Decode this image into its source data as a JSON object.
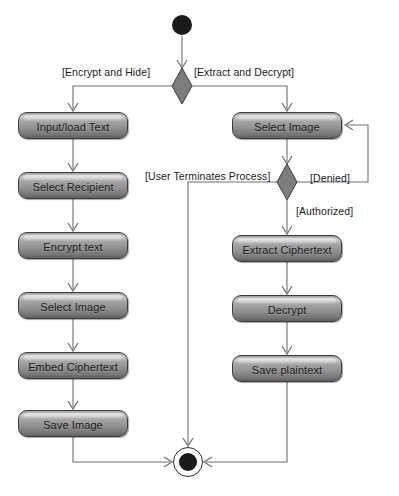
{
  "diagram": {
    "type": "uml-activity-diagram",
    "initial_node": {
      "name": "start",
      "cx": 182,
      "cy": 25,
      "r": 10
    },
    "final_node": {
      "name": "end",
      "cx": 188,
      "cy": 462,
      "outer_r": 15,
      "inner_r": 9
    },
    "decisions": [
      {
        "id": "d1",
        "name": "mode-decision",
        "cx": 182,
        "cy": 86,
        "rx": 10,
        "ry": 18
      },
      {
        "id": "d2",
        "name": "authorization-decision",
        "cx": 287,
        "cy": 182,
        "rx": 10,
        "ry": 18
      }
    ],
    "activities": [
      {
        "id": "a1",
        "label": "Input/load Text",
        "x": 18,
        "y": 112,
        "w": 110,
        "h": 27,
        "branch": "encrypt"
      },
      {
        "id": "a2",
        "label": "Select Recipient",
        "x": 18,
        "y": 172,
        "w": 110,
        "h": 27,
        "branch": "encrypt"
      },
      {
        "id": "a3",
        "label": "Encrypt text",
        "x": 18,
        "y": 232,
        "w": 110,
        "h": 27,
        "branch": "encrypt"
      },
      {
        "id": "a4",
        "label": "Select Image",
        "x": 18,
        "y": 292,
        "w": 110,
        "h": 27,
        "branch": "encrypt"
      },
      {
        "id": "a5",
        "label": "Embed Ciphertext",
        "x": 18,
        "y": 352,
        "w": 110,
        "h": 27,
        "branch": "encrypt"
      },
      {
        "id": "a6",
        "label": "Save Image",
        "x": 18,
        "y": 410,
        "w": 110,
        "h": 27,
        "branch": "encrypt"
      },
      {
        "id": "b1",
        "label": "Select Image",
        "x": 232,
        "y": 112,
        "w": 110,
        "h": 27,
        "branch": "decrypt"
      },
      {
        "id": "b2",
        "label": "Extract Ciphertext",
        "x": 232,
        "y": 235,
        "w": 110,
        "h": 27,
        "branch": "decrypt"
      },
      {
        "id": "b3",
        "label": "Decrypt",
        "x": 232,
        "y": 295,
        "w": 110,
        "h": 27,
        "branch": "decrypt"
      },
      {
        "id": "b4",
        "label": "Save plaintext",
        "x": 232,
        "y": 355,
        "w": 110,
        "h": 27,
        "branch": "decrypt"
      }
    ],
    "guards": [
      {
        "id": "g1",
        "label": "[Encrypt and Hide]",
        "x": 62,
        "y": 66,
        "from": "d1",
        "to": "a1"
      },
      {
        "id": "g2",
        "label": "[Extract and Decrypt]",
        "x": 194,
        "y": 66,
        "from": "d1",
        "to": "b1"
      },
      {
        "id": "g3",
        "label": "[User Terminates Process]",
        "x": 145,
        "y": 170,
        "from": "d2",
        "to": "end"
      },
      {
        "id": "g4",
        "label": "[Denied]",
        "x": 310,
        "y": 172,
        "from": "d2",
        "to": "b1"
      },
      {
        "id": "g5",
        "label": "[Authorized]",
        "x": 296,
        "y": 205,
        "from": "d2",
        "to": "b2"
      }
    ],
    "colors": {
      "node_fill_light": "#cfcfcf",
      "node_fill_dark": "#5f5f5f",
      "node_border": "#3c3c3c",
      "edge_stroke": "#6e6e6e",
      "text": "#1a1a1a",
      "background": "#ffffff",
      "terminal_fill": "#1a1a1a"
    }
  }
}
